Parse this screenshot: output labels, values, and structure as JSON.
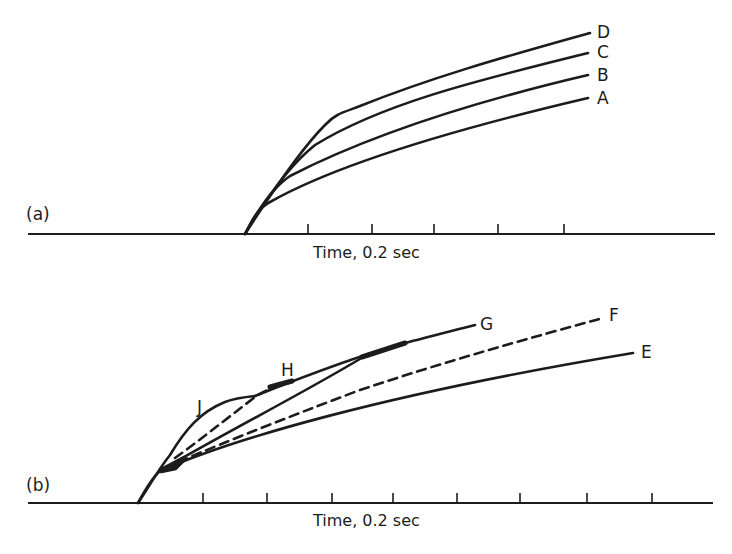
{
  "colors": {
    "ink": "#1c1c1c",
    "background": "#ffffff"
  },
  "panels": [
    {
      "id": "a",
      "label": "(a)",
      "label_pos": [
        26,
        206
      ],
      "axis": {
        "x1": 28,
        "x2": 715,
        "y": 234,
        "label": "Time, 0.2 sec",
        "label_pos": [
          313,
          245
        ]
      },
      "ticks": [
        308,
        372,
        434,
        498,
        564
      ],
      "tick_height": 10,
      "curves": [
        {
          "name": "A",
          "dashed": false,
          "d": "M245,234 C252,220 258,208 270,202 C330,168 430,135 588,98",
          "label_pos": [
            597,
            90
          ]
        },
        {
          "name": "B",
          "dashed": false,
          "d": "M245,234 C258,210 272,188 290,176 C360,140 460,105 588,75",
          "label_pos": [
            597,
            67
          ]
        },
        {
          "name": "C",
          "dashed": false,
          "d": "M245,234 C265,200 290,165 315,145 C380,105 470,82 588,53",
          "label_pos": [
            597,
            44
          ]
        },
        {
          "name": "D",
          "dashed": false,
          "d": "M245,234 C270,195 300,150 325,125 C336,113 345,112 360,106 C430,78 500,58 590,33",
          "label_pos": [
            597,
            24
          ]
        }
      ]
    },
    {
      "id": "b",
      "label": "(b)",
      "label_pos": [
        26,
        477
      ],
      "axis": {
        "x1": 28,
        "x2": 713,
        "y": 503,
        "label": "Time, 0.2 sec",
        "label_pos": [
          313,
          513
        ]
      },
      "ticks": [
        203,
        267,
        332,
        393,
        457,
        520,
        587,
        652
      ],
      "tick_height": 10,
      "curves": [
        {
          "name": "E",
          "dashed": false,
          "d": "M138,503 C145,490 152,478 160,471 C230,440 380,395 633,353",
          "label_pos": [
            641,
            344
          ]
        },
        {
          "name": "F",
          "dashed": true,
          "d": "M165,468 C200,452 280,420 360,390 C450,360 530,338 603,318",
          "label_pos": [
            609,
            307
          ]
        },
        {
          "name": "straight",
          "dashed": false,
          "d": "M165,468 C230,430 300,395 365,356",
          "label_pos": null
        },
        {
          "name": "G",
          "dashed": false,
          "d": "M255,396 C300,378 360,355 405,343 C430,337 455,330 475,325",
          "label_pos": [
            480,
            316
          ]
        },
        {
          "name": "J",
          "dashed": false,
          "d": "M138,503 C150,485 158,470 170,455 C185,430 200,412 225,402 C235,398 245,397 255,396",
          "label_pos": [
            197,
            399
          ]
        },
        {
          "name": "H",
          "dashed": true,
          "d": "M175,458 C200,440 225,420 255,397 C265,390 280,385 292,382",
          "label_pos": [
            281,
            362
          ]
        }
      ],
      "overlaps": [
        {
          "d": "M362,357 L405,343",
          "width": 5
        },
        {
          "d": "M270,387 L292,381",
          "width": 5
        },
        {
          "d": "M160,471 L185,458 L175,468 Z",
          "width": 5
        }
      ]
    }
  ]
}
